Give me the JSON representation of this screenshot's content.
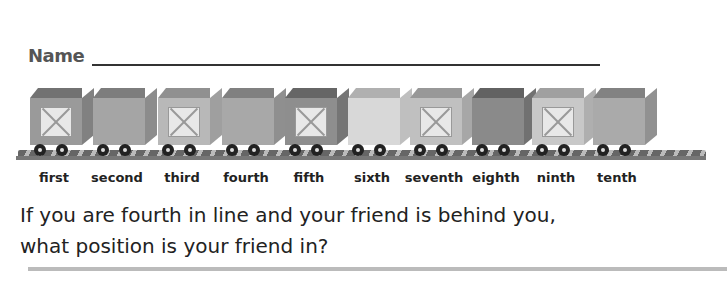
{
  "header": {
    "name_label": "Name"
  },
  "train": {
    "cars": [
      {
        "label": "first",
        "x": 30,
        "color": "#9a9a9a",
        "crate": true
      },
      {
        "label": "second",
        "x": 93,
        "color": "#a5a5a5",
        "crate": false
      },
      {
        "label": "third",
        "x": 158,
        "color": "#b8b8b8",
        "crate": true
      },
      {
        "label": "fourth",
        "x": 222,
        "color": "#a8a8a8",
        "crate": false
      },
      {
        "label": "fifth",
        "x": 285,
        "color": "#8e8e8e",
        "crate": true
      },
      {
        "label": "sixth",
        "x": 348,
        "color": "#d8d8d8",
        "crate": false
      },
      {
        "label": "seventh",
        "x": 410,
        "color": "#c0c0c0",
        "crate": true
      },
      {
        "label": "eighth",
        "x": 472,
        "color": "#8a8a8a",
        "crate": false
      },
      {
        "label": "ninth",
        "x": 532,
        "color": "#c8c8c8",
        "crate": true
      },
      {
        "label": "tenth",
        "x": 593,
        "color": "#aaaaaa",
        "crate": false
      }
    ]
  },
  "labels": [
    "first",
    "second",
    "third",
    "fourth",
    "fifth",
    "sixth",
    "seventh",
    "eighth",
    "ninth",
    "tenth"
  ],
  "question": {
    "line1": "If you are fourth in line and your friend is behind you,",
    "line2": "what position is your friend in?"
  }
}
